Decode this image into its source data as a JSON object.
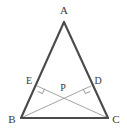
{
  "figure": {
    "kind": "geometry-diagram",
    "background_color": "#ffffff",
    "canvas": {
      "width": 127,
      "height": 135
    }
  },
  "style": {
    "triangle_stroke_color": "#4a4a4a",
    "triangle_stroke_width": 2.1,
    "cevian_stroke_color": "#9a9a9a",
    "cevian_stroke_width": 0.9,
    "right_angle_stroke_color": "#8a8a8a",
    "right_angle_stroke_width": 0.9,
    "label_color": "#3a3a3a"
  },
  "points": [
    {
      "id": "A",
      "label": "A",
      "x": 64,
      "y": 22,
      "label_x": 64,
      "label_y": 11,
      "role": "apex-vertex"
    },
    {
      "id": "B",
      "label": "B",
      "x": 21,
      "y": 118,
      "label_x": 12,
      "label_y": 120,
      "role": "base-vertex-left"
    },
    {
      "id": "C",
      "label": "C",
      "x": 108,
      "y": 118,
      "label_x": 116,
      "label_y": 120,
      "role": "base-vertex-right"
    },
    {
      "id": "E",
      "label": "E",
      "x": 37,
      "y": 86,
      "label_x": 29,
      "label_y": 82,
      "role": "foot-on-AB"
    },
    {
      "id": "D",
      "label": "D",
      "x": 91,
      "y": 86,
      "label_x": 98,
      "label_y": 82,
      "role": "foot-on-AC"
    },
    {
      "id": "P",
      "label": "P",
      "x": 64.5,
      "y": 98,
      "label_x": 63,
      "label_y": 89,
      "role": "intersection"
    }
  ],
  "segments": [
    {
      "id": "AB",
      "from": "A",
      "to": "B",
      "weight": "thick",
      "x1": 64,
      "y1": 22,
      "x2": 21,
      "y2": 118
    },
    {
      "id": "AC",
      "from": "A",
      "to": "C",
      "weight": "thick",
      "x1": 64,
      "y1": 22,
      "x2": 108,
      "y2": 118
    },
    {
      "id": "BC",
      "from": "B",
      "to": "C",
      "weight": "thick",
      "x1": 21,
      "y1": 118,
      "x2": 108,
      "y2": 118
    },
    {
      "id": "BD",
      "from": "B",
      "to": "D",
      "weight": "thin",
      "x1": 21,
      "y1": 118,
      "x2": 91,
      "y2": 86
    },
    {
      "id": "CE",
      "from": "C",
      "to": "E",
      "weight": "thin",
      "x1": 108,
      "y1": 118,
      "x2": 37,
      "y2": 86
    }
  ],
  "right_angle_marks": [
    {
      "id": "angle-at-E",
      "at": "E",
      "path": "M 37.6 91.4 L 42.4 93.6 L 44.6 88.8"
    },
    {
      "id": "angle-at-D",
      "at": "D",
      "path": "M 90.2 91.4 L 85.4 93.6 L 83.2 88.8"
    }
  ]
}
